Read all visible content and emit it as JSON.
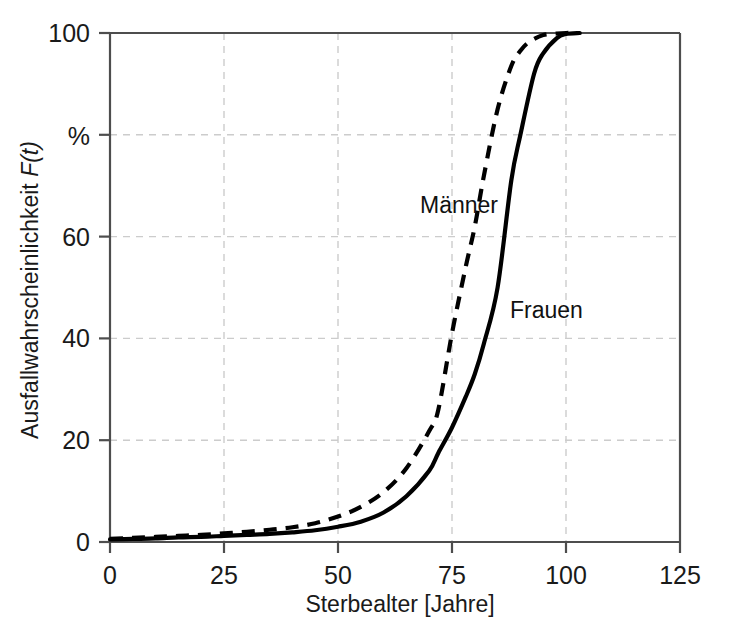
{
  "chart_data": {
    "type": "line",
    "title": "",
    "subtitle": "",
    "xlabel": "Sterbealter [Jahre]",
    "ylabel": "Ausfallwahrscheinlichkeit F(t)",
    "ylabel_plain": "Ausfallwahrscheinlichkeit ",
    "ylabel_italic": "F(t)",
    "xlim": [
      0,
      125
    ],
    "ylim": [
      0,
      100
    ],
    "xticks": [
      0,
      25,
      50,
      75,
      100,
      125
    ],
    "xtick_labels": [
      "0",
      "25",
      "50",
      "75",
      "100",
      "125"
    ],
    "yticks": [
      0,
      20,
      40,
      60,
      80,
      100
    ],
    "ytick_labels": [
      "0",
      "20",
      "40",
      "60",
      "%",
      "100"
    ],
    "y_unit_label": "%",
    "y_unit_note": "The 80 tick is labelled with the unit symbol % instead of the number",
    "grid": true,
    "grid_style": "dashed",
    "grid_color": "#cccccc",
    "legend_position": "inline-annotation",
    "annotations": [
      {
        "text": "Männer",
        "x": 62,
        "y": 67,
        "series": "Männer"
      },
      {
        "text": "Frauen",
        "x": 80,
        "y": 46,
        "series": "Frauen"
      }
    ],
    "series": [
      {
        "name": "Männer",
        "style": "dashed",
        "color": "#000000",
        "x": [
          0,
          5,
          10,
          15,
          20,
          25,
          30,
          35,
          40,
          45,
          50,
          55,
          60,
          65,
          70,
          72,
          75,
          78,
          80,
          82,
          85,
          88,
          90,
          92,
          95,
          98,
          100,
          103
        ],
        "values": [
          0.6,
          0.8,
          1.0,
          1.2,
          1.4,
          1.7,
          2.0,
          2.4,
          2.9,
          3.7,
          5.0,
          6.9,
          9.8,
          14.5,
          21.8,
          26.0,
          41.0,
          54.0,
          62.0,
          72.0,
          85.0,
          93.5,
          96.5,
          98.3,
          99.6,
          99.9,
          100.0,
          100.0
        ]
      },
      {
        "name": "Frauen",
        "style": "solid",
        "color": "#000000",
        "x": [
          0,
          5,
          10,
          15,
          20,
          25,
          30,
          35,
          40,
          45,
          50,
          55,
          60,
          65,
          70,
          72,
          75,
          78,
          80,
          82,
          85,
          88,
          90,
          93,
          95,
          98,
          100,
          103
        ],
        "values": [
          0.5,
          0.6,
          0.7,
          0.9,
          1.0,
          1.2,
          1.4,
          1.6,
          1.9,
          2.3,
          3.0,
          4.0,
          5.8,
          9.0,
          14.0,
          17.5,
          22.5,
          28.5,
          33.0,
          39.0,
          50.0,
          71.0,
          80.0,
          92.0,
          96.0,
          99.0,
          99.8,
          100.0
        ]
      }
    ]
  }
}
